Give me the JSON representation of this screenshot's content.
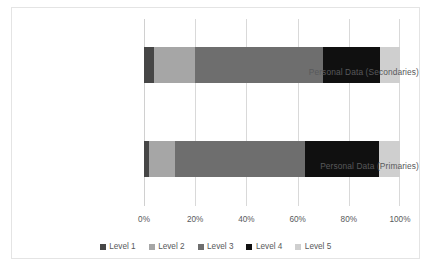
{
  "chart_data": {
    "type": "bar",
    "orientation": "horizontal",
    "stacked": true,
    "normalized_percent": true,
    "title": "",
    "xlabel": "",
    "ylabel": "",
    "xlim": [
      0,
      100
    ],
    "grid": true,
    "legend_position": "bottom",
    "categories": [
      "Personal Data (Secondaries)",
      "Personal Data (Primaries)"
    ],
    "xtick_labels": [
      "0%",
      "20%",
      "40%",
      "60%",
      "80%",
      "100%"
    ],
    "xtick_values": [
      0,
      20,
      40,
      60,
      80,
      100
    ],
    "series": [
      {
        "name": "Level 1",
        "color": "#464646",
        "values": [
          4,
          2
        ]
      },
      {
        "name": "Level 2",
        "color": "#a6a6a6",
        "values": [
          16,
          10
        ]
      },
      {
        "name": "Level 3",
        "color": "#6e6e6e",
        "values": [
          50,
          51
        ]
      },
      {
        "name": "Level 4",
        "color": "#101010",
        "values": [
          22,
          29
        ]
      },
      {
        "name": "Level 5",
        "color": "#cfcfcf",
        "values": [
          8,
          8
        ]
      }
    ]
  }
}
